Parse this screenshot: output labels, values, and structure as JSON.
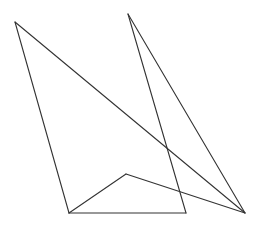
{
  "canvas": {
    "width": 260,
    "height": 231,
    "background": "#ffffff"
  },
  "stroke": {
    "color": "#333333",
    "width": 1.1
  },
  "points": {
    "A": [
      15,
      22
    ],
    "B": [
      128,
      14
    ],
    "C": [
      245,
      213
    ],
    "D": [
      69,
      213
    ],
    "E": [
      186,
      213
    ],
    "F": [
      126,
      174
    ]
  },
  "segments": [
    {
      "name": "segment-a-c",
      "from": "A",
      "to": "C"
    },
    {
      "name": "segment-a-d",
      "from": "A",
      "to": "D"
    },
    {
      "name": "segment-d-e",
      "from": "D",
      "to": "E"
    },
    {
      "name": "segment-e-b",
      "from": "E",
      "to": "B"
    },
    {
      "name": "segment-b-c",
      "from": "B",
      "to": "C"
    },
    {
      "name": "segment-d-f",
      "from": "D",
      "to": "F"
    },
    {
      "name": "segment-f-c",
      "from": "F",
      "to": "C"
    }
  ]
}
